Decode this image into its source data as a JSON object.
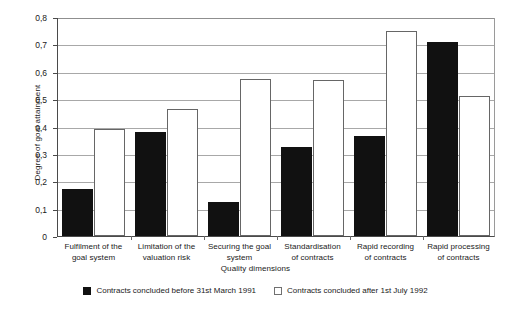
{
  "chart_data": {
    "type": "bar",
    "title": "",
    "xlabel": "Quality dimensions",
    "ylabel": "Degree of goal attainment",
    "ylim": [
      0,
      0.8
    ],
    "ytick_labels": [
      "0",
      "0,1",
      "0,2",
      "0,3",
      "0,4",
      "0,5",
      "0,6",
      "0,7",
      "0,8"
    ],
    "ytick_values": [
      0,
      0.1,
      0.2,
      0.3,
      0.4,
      0.5,
      0.6,
      0.7,
      0.8
    ],
    "grid": true,
    "legend_position": "bottom-center",
    "categories": [
      "Fulfilment of the goal system",
      "Limitation of the valuation risk",
      "Securing the goal system",
      "Standardisation of contracts",
      "Rapid recording of contracts",
      "Rapid processing of contracts"
    ],
    "category_lines": [
      [
        "Fulfilment of the",
        "goal system"
      ],
      [
        "Limitation of the",
        "valuation risk"
      ],
      [
        "Securing the goal",
        "system"
      ],
      [
        "Standardisation",
        "of contracts"
      ],
      [
        "Rapid recording",
        "of contracts"
      ],
      [
        "Rapid processing",
        "of contracts"
      ]
    ],
    "series": [
      {
        "name": "Contracts concluded before 31st March 1991",
        "color": "#111111",
        "values": [
          0.17,
          0.38,
          0.125,
          0.325,
          0.365,
          0.71
        ]
      },
      {
        "name": "Contracts concluded after 1st July 1992",
        "color": "#ffffff",
        "values": [
          0.39,
          0.465,
          0.575,
          0.57,
          0.75,
          0.51
        ]
      }
    ]
  },
  "legend": {
    "entries": [
      {
        "label": "Contracts concluded before 31st March 1991",
        "swatch": "dark"
      },
      {
        "label": "Contracts concluded after 1st July 1992",
        "swatch": "light"
      }
    ]
  }
}
